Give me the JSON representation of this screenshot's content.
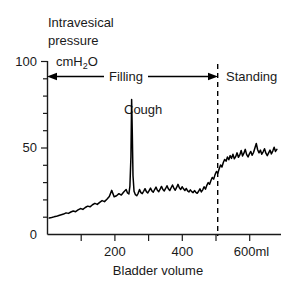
{
  "chart_data": {
    "type": "line",
    "title": "",
    "xlabel": "Bladder volume",
    "ylabel": "Intravesical pressure cmH2O",
    "ylabel_line1": "Intravesical",
    "ylabel_line2": "pressure",
    "ylabel_unit_prefix": "cmH",
    "ylabel_unit_sub": "2",
    "ylabel_unit_suffix": "O",
    "xlim": [
      0,
      680
    ],
    "ylim": [
      0,
      100
    ],
    "x_ticks": [
      0,
      100,
      200,
      300,
      400,
      500,
      600
    ],
    "x_tick_labels": [
      "",
      "",
      "200",
      "",
      "400",
      "",
      "600ml"
    ],
    "y_ticks": [
      0,
      10,
      20,
      30,
      40,
      50,
      60,
      70,
      80,
      90,
      100
    ],
    "y_tick_labels": [
      "0",
      "",
      "",
      "",
      "",
      "50",
      "",
      "",
      "",
      "",
      "100"
    ],
    "grid": false,
    "legend": "none",
    "line_color": "#000000",
    "axis_color": "#1a1a1a",
    "series": [
      {
        "name": "Intravesical pressure",
        "x": [
          5,
          12,
          19,
          26,
          33,
          40,
          47,
          54,
          61,
          68,
          75,
          82,
          89,
          96,
          103,
          110,
          117,
          124,
          131,
          138,
          145,
          152,
          159,
          166,
          173,
          180,
          187,
          194,
          201,
          208,
          215,
          222,
          229,
          233,
          237,
          240,
          243,
          245,
          247,
          249,
          252,
          256,
          260,
          264,
          268,
          272,
          276,
          280,
          284,
          288,
          292,
          296,
          300,
          304,
          308,
          312,
          316,
          320,
          324,
          328,
          332,
          336,
          340,
          344,
          348,
          352,
          356,
          360,
          364,
          368,
          372,
          376,
          380,
          384,
          388,
          392,
          396,
          400,
          404,
          408,
          412,
          416,
          420,
          424,
          428,
          432,
          436,
          440,
          444,
          448,
          452,
          456,
          460,
          464,
          468,
          472,
          476,
          480,
          484,
          488,
          492,
          496,
          500,
          504,
          508,
          512,
          516,
          520,
          524,
          528,
          532,
          536,
          540,
          544,
          548,
          552,
          556,
          560,
          564,
          568,
          572,
          576,
          580,
          584,
          588,
          592,
          596,
          600,
          604,
          608,
          612,
          616,
          620,
          624,
          628,
          632,
          636,
          640,
          644,
          648,
          652,
          656,
          660,
          664,
          668
        ],
        "y": [
          9.5,
          9.8,
          10.2,
          10.5,
          11.0,
          11.4,
          11.8,
          12.5,
          12.2,
          13.0,
          13.6,
          13.2,
          14.2,
          15.0,
          14.5,
          15.6,
          16.4,
          16.0,
          17.2,
          18.0,
          17.4,
          18.6,
          19.6,
          19.0,
          20.4,
          22.0,
          25.5,
          21.8,
          22.4,
          23.6,
          22.8,
          24.6,
          26.0,
          24.0,
          23.4,
          28.0,
          45.0,
          78.0,
          58.0,
          34.0,
          25.0,
          23.0,
          22.4,
          23.8,
          26.0,
          24.2,
          23.6,
          25.0,
          26.5,
          24.8,
          24.0,
          25.4,
          26.8,
          25.2,
          24.4,
          26.0,
          27.4,
          25.6,
          24.8,
          26.2,
          27.8,
          26.0,
          25.2,
          26.6,
          28.2,
          26.4,
          25.4,
          27.0,
          28.6,
          26.8,
          25.6,
          27.2,
          29.0,
          27.0,
          26.0,
          27.6,
          26.4,
          25.4,
          26.6,
          25.2,
          24.6,
          25.8,
          24.8,
          24.2,
          25.4,
          24.4,
          23.8,
          25.0,
          26.4,
          24.6,
          25.8,
          27.6,
          26.2,
          28.4,
          30.0,
          29.0,
          31.2,
          33.0,
          32.0,
          34.6,
          36.4,
          35.4,
          38.0,
          40.2,
          39.0,
          41.6,
          43.4,
          42.4,
          44.8,
          43.2,
          45.6,
          44.0,
          46.4,
          43.8,
          45.0,
          47.2,
          44.6,
          46.0,
          48.6,
          45.4,
          47.0,
          49.2,
          46.2,
          44.8,
          46.6,
          48.0,
          45.8,
          47.4,
          50.0,
          52.6,
          49.0,
          47.2,
          48.8,
          46.4,
          47.8,
          49.6,
          47.0,
          45.6,
          47.2,
          48.8,
          46.6,
          48.2,
          50.4,
          48.0,
          49.2
        ]
      }
    ],
    "annotations": [
      {
        "name": "cough-spike",
        "label": "Cough",
        "x": 245,
        "y": 78,
        "label_x": 262,
        "label_y": 82
      },
      {
        "name": "filling-phase",
        "label": "Filling",
        "x_start": 0,
        "x_end": 505,
        "y": 88,
        "arrow": "double"
      },
      {
        "name": "standing-phase",
        "label": "Standing",
        "x_start": 505,
        "x_end": 680,
        "y": 88,
        "arrow": "none"
      },
      {
        "name": "phase-divider",
        "label": "",
        "x": 505,
        "style": "dashed"
      }
    ]
  }
}
